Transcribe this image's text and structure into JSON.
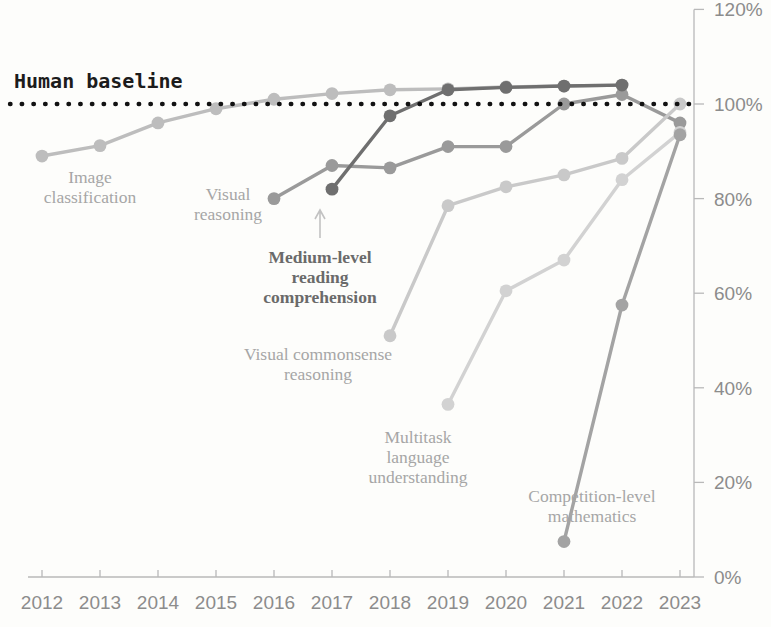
{
  "chart_data": {
    "type": "line",
    "title": "",
    "subtitle": "",
    "xlabel": "",
    "ylabel": "",
    "x": [
      2012,
      2013,
      2014,
      2015,
      2016,
      2017,
      2018,
      2019,
      2020,
      2021,
      2022,
      2023
    ],
    "xtick_labels": [
      "2012",
      "2013",
      "2014",
      "2015",
      "2016",
      "2017",
      "2018",
      "2019",
      "2020",
      "2021",
      "2022",
      "2023"
    ],
    "ytick_labels": [
      "0%",
      "20%",
      "40%",
      "60%",
      "80%",
      "100%",
      "120%"
    ],
    "ytick_values": [
      0,
      20,
      40,
      60,
      80,
      100,
      120
    ],
    "ylim": [
      0,
      120
    ],
    "xlim": [
      2012,
      2023
    ],
    "grid": false,
    "legend": "inline-annotations",
    "baseline": {
      "label": "Human baseline",
      "value": 100,
      "style": "dotted",
      "color": "#121212"
    },
    "series": [
      {
        "name": "Image classification",
        "label": "Image\nclassification",
        "color": "#bdbdbd",
        "label_color": "#a6a6a6",
        "points": [
          {
            "x": 2012,
            "y": 89.0
          },
          {
            "x": 2013,
            "y": 91.2
          },
          {
            "x": 2014,
            "y": 96.0
          },
          {
            "x": 2015,
            "y": 99.0
          },
          {
            "x": 2016,
            "y": 101.0
          },
          {
            "x": 2017,
            "y": 102.2
          },
          {
            "x": 2018,
            "y": 103.0
          },
          {
            "x": 2019,
            "y": 103.2
          },
          {
            "x": 2020,
            "y": 103.6
          },
          {
            "x": 2021,
            "y": 103.8
          },
          {
            "x": 2022,
            "y": 104.0
          }
        ]
      },
      {
        "name": "Visual reasoning",
        "label": "Visual\nreasoning",
        "color": "#9a9a9a",
        "label_color": "#8a8a8a",
        "points": [
          {
            "x": 2016,
            "y": 80.0
          },
          {
            "x": 2017,
            "y": 87.0
          },
          {
            "x": 2018,
            "y": 86.5
          },
          {
            "x": 2019,
            "y": 91.0
          },
          {
            "x": 2020,
            "y": 91.0
          },
          {
            "x": 2021,
            "y": 100.0
          },
          {
            "x": 2022,
            "y": 102.0
          },
          {
            "x": 2023,
            "y": 96.0
          }
        ]
      },
      {
        "name": "Medium-level reading comprehension",
        "label": "Medium-level\nreading\ncomprehension",
        "color": "#6f6f6f",
        "label_color": "#5c5c5c",
        "points": [
          {
            "x": 2017,
            "y": 82.0
          },
          {
            "x": 2018,
            "y": 97.5
          },
          {
            "x": 2019,
            "y": 103.0
          },
          {
            "x": 2020,
            "y": 103.5
          },
          {
            "x": 2021,
            "y": 103.8
          },
          {
            "x": 2022,
            "y": 104.0
          }
        ]
      },
      {
        "name": "Visual commonsense reasoning",
        "label": "Visual commonsense\nreasoning",
        "color": "#c9c9c9",
        "label_color": "#b3b3b3",
        "points": [
          {
            "x": 2018,
            "y": 51.0
          },
          {
            "x": 2019,
            "y": 78.5
          },
          {
            "x": 2020,
            "y": 82.5
          },
          {
            "x": 2021,
            "y": 85.0
          },
          {
            "x": 2022,
            "y": 88.5
          },
          {
            "x": 2023,
            "y": 100.0
          }
        ]
      },
      {
        "name": "Multitask language understanding",
        "label": "Multitask\nlanguage\nunderstanding",
        "color": "#d2d2d2",
        "label_color": "#b8b8b8",
        "points": [
          {
            "x": 2019,
            "y": 36.5
          },
          {
            "x": 2020,
            "y": 60.5
          },
          {
            "x": 2021,
            "y": 67.0
          },
          {
            "x": 2022,
            "y": 84.0
          },
          {
            "x": 2023,
            "y": 94.0
          }
        ]
      },
      {
        "name": "Competition-level mathematics",
        "label": "Competition-level\nmathematics",
        "color": "#a3a3a3",
        "label_color": "#4f4f4f",
        "points": [
          {
            "x": 2021,
            "y": 7.5
          },
          {
            "x": 2022,
            "y": 57.5
          },
          {
            "x": 2023,
            "y": 93.5
          }
        ]
      }
    ],
    "annotations": [
      {
        "name": "image-classification-label",
        "text_lines": [
          "Image",
          "classification"
        ],
        "x": 90,
        "y": 183,
        "color": "#a6a6a6",
        "bold": false
      },
      {
        "name": "visual-reasoning-label",
        "text_lines": [
          "Visual",
          "reasoning"
        ],
        "x": 228,
        "y": 200,
        "color": "#8a8a8a",
        "bold": false
      },
      {
        "name": "medium-level-reading-comprehension-label",
        "text_lines": [
          "Medium-level",
          "reading",
          "comprehension"
        ],
        "x": 320,
        "y": 263,
        "color": "#5c5c5c",
        "bold": true
      },
      {
        "name": "visual-commonsense-reasoning-label",
        "text_lines": [
          "Visual commonsense",
          "reasoning"
        ],
        "x": 318,
        "y": 360,
        "color": "#b3b3b3",
        "bold": false
      },
      {
        "name": "multitask-language-understanding-label",
        "text_lines": [
          "Multitask",
          "language",
          "understanding"
        ],
        "x": 418,
        "y": 443,
        "color": "#b8b8b8",
        "bold": false
      },
      {
        "name": "competition-level-mathematics-label",
        "text_lines": [
          "Competition-level",
          "mathematics"
        ],
        "x": 592,
        "y": 502,
        "color": "#4f4f4f",
        "bold": false
      }
    ]
  }
}
